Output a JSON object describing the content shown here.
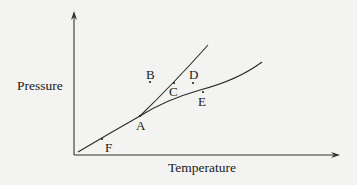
{
  "diagram": {
    "type": "phase-diagram",
    "axes": {
      "x_label": "Temperature",
      "y_label": "Pressure"
    },
    "curves": [
      {
        "name": "sublimation-curve",
        "from": "origin",
        "to": "A"
      },
      {
        "name": "melting-curve",
        "from": "A",
        "direction": "steep-upward"
      },
      {
        "name": "vaporization-curve",
        "from": "A",
        "direction": "shallow-upward"
      }
    ],
    "points": {
      "A": "A",
      "B": "B",
      "C": "C",
      "D": "D",
      "E": "E",
      "F": "F"
    }
  }
}
